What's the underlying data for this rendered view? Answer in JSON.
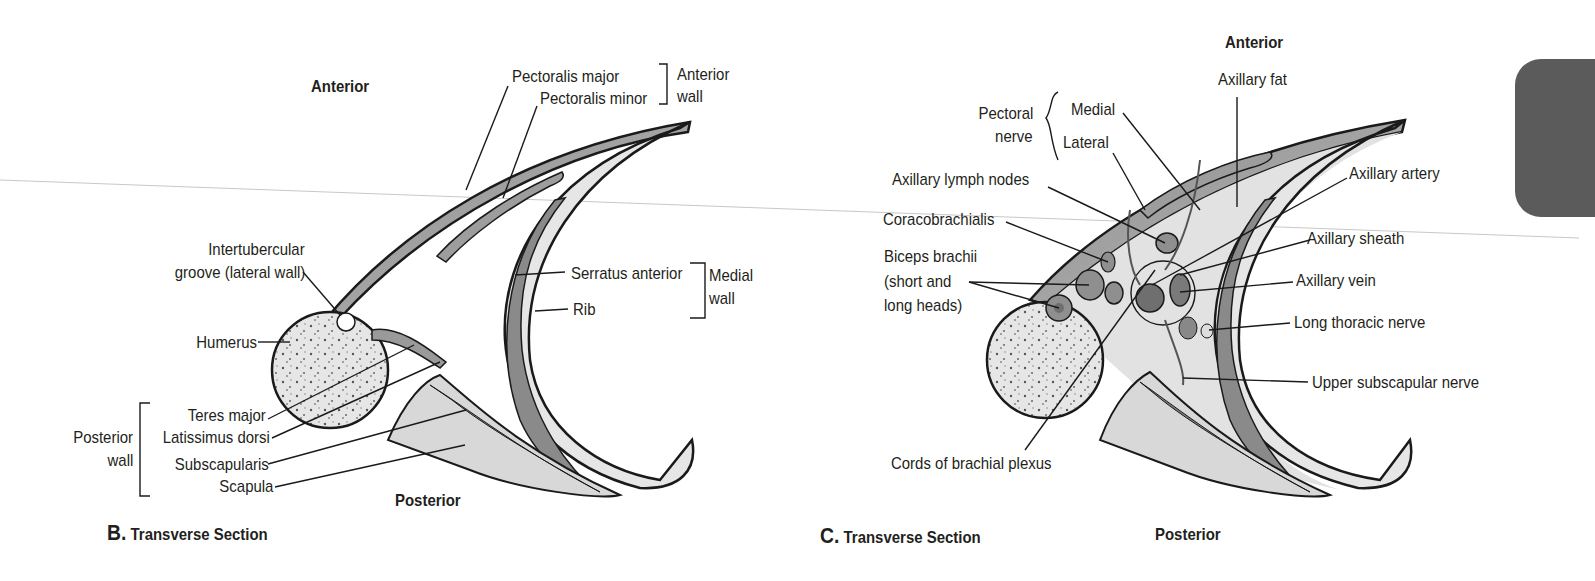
{
  "figure": {
    "panels": [
      {
        "id": "B",
        "caption_letter": "B.",
        "caption_text": "Transverse Section",
        "orientation": {
          "top": "Anterior",
          "bottom": "Posterior"
        },
        "labels": {
          "pectoralis_major": "Pectoralis major",
          "pectoralis_minor": "Pectoralis minor",
          "anterior_wall_1": "Anterior",
          "anterior_wall_2": "wall",
          "intertubercular_1": "Intertubercular",
          "intertubercular_2": "groove (lateral wall)",
          "serratus_anterior": "Serratus anterior",
          "rib": "Rib",
          "medial_wall_1": "Medial",
          "medial_wall_2": "wall",
          "humerus": "Humerus",
          "teres_major": "Teres major",
          "latissimus_dorsi": "Latissimus dorsi",
          "subscapularis": "Subscapularis",
          "scapula": "Scapula",
          "posterior_wall_1": "Posterior",
          "posterior_wall_2": "wall"
        }
      },
      {
        "id": "C",
        "caption_letter": "C.",
        "caption_text": "Transverse Section",
        "orientation": {
          "top": "Anterior",
          "bottom": "Posterior"
        },
        "labels": {
          "pectoral_nerve_1": "Pectoral",
          "pectoral_nerve_2": "nerve",
          "medial": "Medial",
          "lateral": "Lateral",
          "axillary_fat": "Axillary fat",
          "axillary_lymph_nodes": "Axillary lymph nodes",
          "axillary_artery": "Axillary artery",
          "coracobrachialis": "Coracobrachialis",
          "axillary_sheath": "Axillary sheath",
          "biceps_1": "Biceps brachii",
          "biceps_2": "(short and",
          "biceps_3": "long heads)",
          "axillary_vein": "Axillary vein",
          "long_thoracic_nerve": "Long thoracic nerve",
          "upper_subscapular_nerve": "Upper subscapular nerve",
          "cords_brachial_plexus": "Cords of brachial plexus"
        }
      }
    ],
    "colors": {
      "muscle": "#9a9a9a",
      "muscle_light": "#bdbdbd",
      "bone": "#e4e4e4",
      "fat": "#e8e8e8",
      "outline": "#1a1a1a",
      "tab": "#5b5b5b"
    }
  }
}
